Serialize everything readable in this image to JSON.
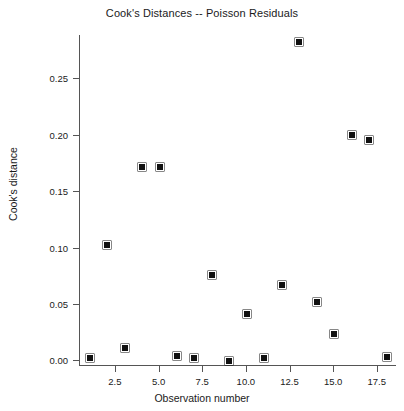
{
  "chart_data": {
    "type": "scatter",
    "title": "Cook's Distances -- Poisson Residuals",
    "xlabel": "Observation number",
    "ylabel": "Cook's distance",
    "x": [
      1,
      2,
      3,
      4,
      5,
      6,
      7,
      8,
      9,
      10,
      11,
      12,
      13,
      14,
      15,
      16,
      17,
      18
    ],
    "values": [
      0.003,
      0.103,
      0.012,
      0.172,
      0.172,
      0.005,
      0.003,
      0.077,
      0.0,
      0.042,
      0.003,
      0.068,
      0.283,
      0.053,
      0.024,
      0.201,
      0.196,
      0.004
    ],
    "xticks": [
      2.5,
      5.0,
      7.5,
      10.0,
      12.5,
      15.0,
      17.5
    ],
    "xtick_labels": [
      "2.5",
      "5.0",
      "7.5",
      "10.0",
      "12.5",
      "15.0",
      "17.5"
    ],
    "yticks": [
      0.0,
      0.05,
      0.1,
      0.15,
      0.2,
      0.25
    ],
    "ytick_labels": [
      "0.00",
      "0.05",
      "0.10",
      "0.15",
      "0.20",
      "0.25"
    ],
    "xlim": [
      0.5,
      18.6
    ],
    "ylim": [
      -0.004,
      0.2885
    ],
    "grid": false,
    "legend": null,
    "marker": "square",
    "marker_color": "#111111"
  }
}
